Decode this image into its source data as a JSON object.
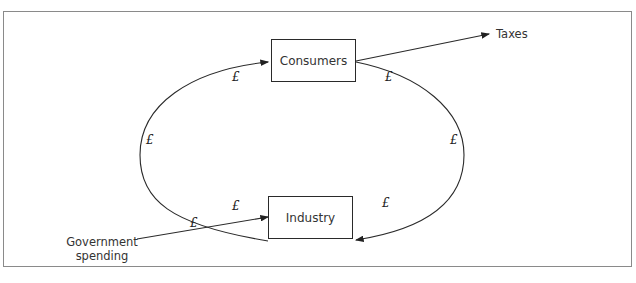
{
  "diagram": {
    "type": "circular-flow",
    "nodes": {
      "consumers": {
        "label": "Consumers"
      },
      "industry": {
        "label": "Industry"
      }
    },
    "external": {
      "taxes": {
        "label": "Taxes"
      },
      "government_spending": {
        "label_line1": "Government",
        "label_line2": "spending"
      }
    },
    "money_symbol": "£",
    "edges": [
      {
        "from": "industry",
        "to": "consumers",
        "side": "left",
        "label": "£"
      },
      {
        "from": "consumers",
        "to": "industry",
        "side": "right",
        "label": "£"
      },
      {
        "from": "consumers",
        "to": "taxes",
        "label": ""
      },
      {
        "from": "government_spending",
        "to": "industry",
        "label": "£"
      }
    ],
    "colors": {
      "line": "#2a2a2a",
      "frame": "#8a8a8a",
      "text": "#333333"
    }
  }
}
